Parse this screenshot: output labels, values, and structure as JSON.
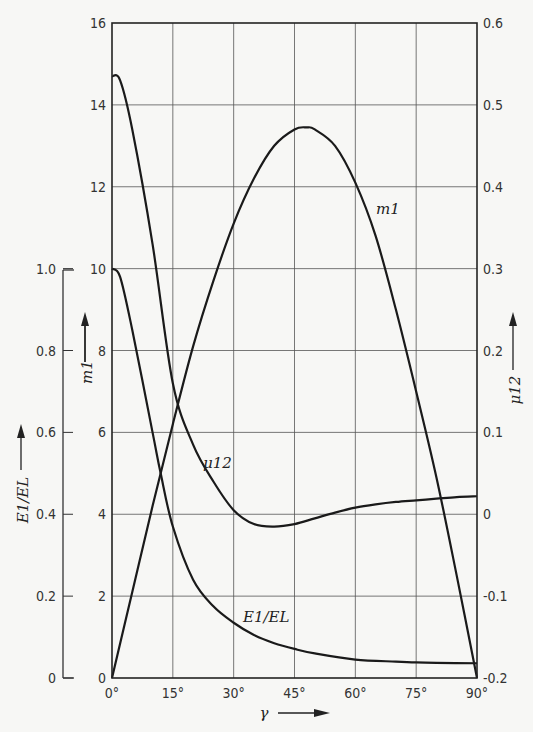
{
  "chart_data": {
    "type": "line",
    "title": "",
    "xlabel": "γ",
    "x_unit": "degrees",
    "xlim": [
      0,
      90
    ],
    "x_ticks": [
      "0°",
      "15°",
      "30°",
      "45°",
      "60°",
      "75°",
      "90°"
    ],
    "grid": true,
    "axes": {
      "left_outer": {
        "label": "E1/EL",
        "range": [
          0,
          1.0
        ],
        "ticks": [
          "0",
          "0.2",
          "0.4",
          "0.6",
          "0.8",
          "1.0"
        ]
      },
      "left_inner": {
        "label": "m1",
        "range": [
          0,
          16
        ],
        "ticks": [
          "0",
          "2",
          "4",
          "6",
          "8",
          "10",
          "12",
          "14",
          "16"
        ]
      },
      "right": {
        "label": "μ12",
        "range": [
          -0.2,
          0.6
        ],
        "ticks": [
          "-0.2",
          "-0.1",
          "0",
          "0.1",
          "0.2",
          "0.3",
          "0.4",
          "0.5",
          "0.6"
        ]
      }
    },
    "series": [
      {
        "name": "m1",
        "axis": "left_inner",
        "x": [
          0,
          5,
          10,
          15,
          20,
          25,
          30,
          35,
          40,
          45,
          48,
          50,
          55,
          60,
          65,
          70,
          75,
          80,
          85,
          90
        ],
        "values": [
          0,
          2.1,
          4.2,
          6.2,
          8.1,
          9.7,
          11.1,
          12.2,
          13.0,
          13.4,
          13.45,
          13.4,
          13.0,
          12.1,
          10.8,
          9.0,
          7.0,
          4.9,
          2.5,
          0
        ]
      },
      {
        "name": "μ12",
        "axis": "right",
        "x": [
          0,
          2,
          5,
          10,
          15,
          20,
          25,
          30,
          35,
          40,
          45,
          50,
          55,
          60,
          65,
          70,
          75,
          80,
          85,
          90
        ],
        "values": [
          0.535,
          0.53,
          0.47,
          0.33,
          0.16,
          0.085,
          0.04,
          0.005,
          -0.012,
          -0.015,
          -0.012,
          -0.005,
          0.002,
          0.008,
          0.012,
          0.015,
          0.017,
          0.019,
          0.021,
          0.022
        ]
      },
      {
        "name": "E1/EL",
        "axis": "left_outer",
        "x": [
          0,
          2,
          5,
          10,
          12,
          15,
          20,
          25,
          30,
          35,
          40,
          45,
          50,
          60,
          70,
          75,
          80,
          90
        ],
        "values": [
          1.0,
          0.98,
          0.85,
          0.6,
          0.5,
          0.37,
          0.24,
          0.175,
          0.135,
          0.105,
          0.085,
          0.071,
          0.06,
          0.045,
          0.04,
          0.038,
          0.037,
          0.036
        ]
      }
    ],
    "annotations": [
      {
        "text": "m1",
        "near_x": 60,
        "near_value_m1": 11.2
      },
      {
        "text": "μ12",
        "near_x": 22,
        "near_value_m1": 5.3
      },
      {
        "text": "E1/EL",
        "near_x": 38,
        "near_value_m1": 1.5
      }
    ]
  },
  "labels": {
    "x_axis": "γ",
    "left_outer_axis": "E1/EL",
    "left_inner_axis": "m1",
    "right_axis": "μ12",
    "curve_m1": "m1",
    "curve_mu12": "μ12",
    "curve_e1el": "E1/EL"
  }
}
